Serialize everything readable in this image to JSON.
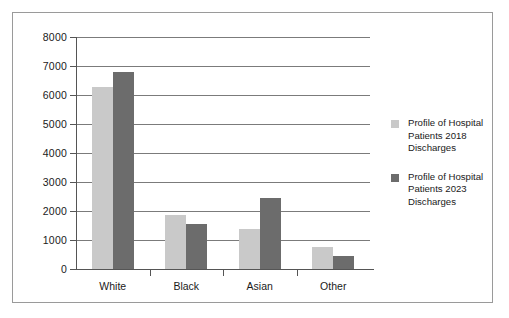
{
  "chart_data": {
    "type": "bar",
    "title": "",
    "xlabel": "",
    "ylabel": "",
    "categories": [
      "White",
      "Black",
      "Asian",
      "Other"
    ],
    "series": [
      {
        "name": "Profile of Hospital Patients 2018 Discharges",
        "color": "#c9c9c9",
        "values": [
          6280,
          1850,
          1370,
          750
        ]
      },
      {
        "name": "Profile of Hospital Patients 2023 Discharges",
        "color": "#6c6c6c",
        "values": [
          6800,
          1560,
          2450,
          460
        ]
      }
    ],
    "ylim": [
      0,
      8000
    ],
    "ytick_labels": [
      "0",
      "1000",
      "2000",
      "3000",
      "4000",
      "5000",
      "6000",
      "7000",
      "8000"
    ],
    "ytick_values": [
      0,
      1000,
      2000,
      3000,
      4000,
      5000,
      6000,
      7000,
      8000
    ],
    "grid": true,
    "legend_position": "right"
  },
  "legend": {
    "entries": [
      {
        "label_line1": "Profile of Hospital",
        "label_line2": "Patients 2018",
        "label_line3": "Discharges"
      },
      {
        "label_line1": "Profile of Hospital",
        "label_line2": "Patients 2023",
        "label_line3": "Discharges"
      }
    ]
  },
  "colors": {
    "series_2018": "#c9c9c9",
    "series_2023": "#6c6c6c",
    "gridline": "#7b7b7b",
    "axis": "#555555",
    "frame_border": "#9a9a9a",
    "background": "#ffffff",
    "text": "#1a1a1a"
  }
}
